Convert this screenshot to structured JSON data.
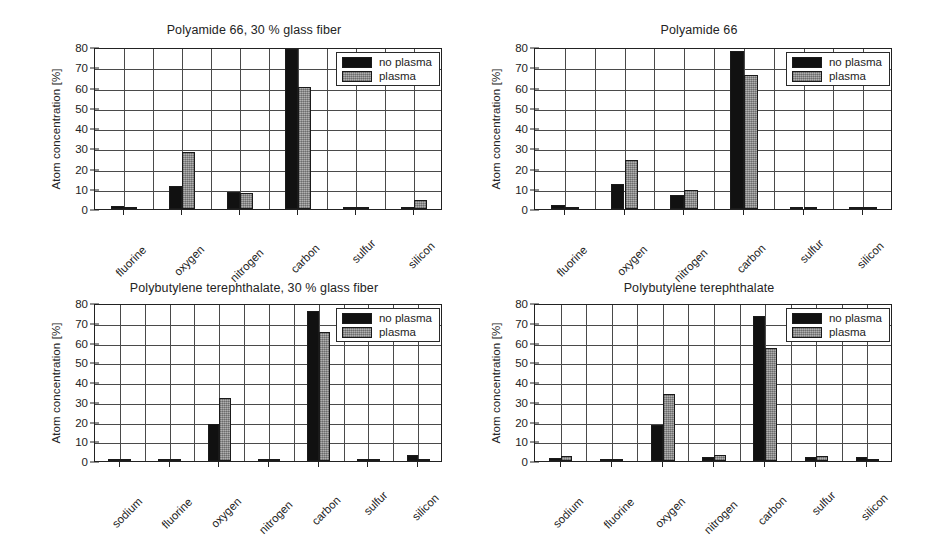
{
  "figure": {
    "background": "#ffffff",
    "axis_color": "#222222",
    "grid_color": "#4a4a4a",
    "series_colors": [
      "#111111",
      "#9d9d9d"
    ]
  },
  "chart_data": [
    {
      "type": "bar",
      "title": "Polyamide 66, 30 % glass fiber",
      "xlabel": "",
      "ylabel": "Atom concentration [%]",
      "ylim": [
        0,
        80
      ],
      "yticks": [
        0,
        10,
        20,
        30,
        40,
        50,
        60,
        70,
        80
      ],
      "grid": true,
      "legend_position": "top-right",
      "categories": [
        "fluorine",
        "oxygen",
        "nitrogen",
        "carbon",
        "sulfur",
        "silicon"
      ],
      "series": [
        {
          "name": "no plasma",
          "values": [
            1.3,
            11.2,
            8.3,
            79.0,
            0.3,
            1.2
          ]
        },
        {
          "name": "plasma",
          "values": [
            0.2,
            28.3,
            7.9,
            60.4,
            0.3,
            4.3
          ]
        }
      ]
    },
    {
      "type": "bar",
      "title": "Polyamide 66",
      "xlabel": "",
      "ylabel": "Atom concentration [%]",
      "ylim": [
        0,
        80
      ],
      "yticks": [
        0,
        10,
        20,
        30,
        40,
        50,
        60,
        70,
        80
      ],
      "grid": true,
      "legend_position": "top-right",
      "categories": [
        "fluorine",
        "oxygen",
        "nitrogen",
        "carbon",
        "sulfur",
        "silicon"
      ],
      "series": [
        {
          "name": "no plasma",
          "values": [
            1.8,
            12.4,
            7.1,
            78.2,
            0.6,
            0.6
          ]
        },
        {
          "name": "plasma",
          "values": [
            0.2,
            24.1,
            9.3,
            66.2,
            0.5,
            0.5
          ]
        }
      ]
    },
    {
      "type": "bar",
      "title": "Polybutylene terephthalate, 30 % glass fiber",
      "xlabel": "",
      "ylabel": "Atom concentration [%]",
      "ylim": [
        0,
        80
      ],
      "yticks": [
        0,
        10,
        20,
        30,
        40,
        50,
        60,
        70,
        80
      ],
      "grid": true,
      "legend_position": "top-right",
      "categories": [
        "sodium",
        "fluorine",
        "oxygen",
        "nitrogen",
        "carbon",
        "sulfur",
        "silicon"
      ],
      "series": [
        {
          "name": "no plasma",
          "values": [
            0.6,
            1.1,
            18.5,
            1.1,
            76.2,
            0.9,
            3.0
          ]
        },
        {
          "name": "plasma",
          "values": [
            0.5,
            0.3,
            32.0,
            1.0,
            65.3,
            0.8,
            1.1
          ]
        }
      ]
    },
    {
      "type": "bar",
      "title": "Polybutylene terephthalate",
      "xlabel": "",
      "ylabel": "Atom concentration [%]",
      "ylim": [
        0,
        80
      ],
      "yticks": [
        0,
        10,
        20,
        30,
        40,
        50,
        60,
        70,
        80
      ],
      "grid": true,
      "legend_position": "top-right",
      "categories": [
        "sodium",
        "fluorine",
        "oxygen",
        "nitrogen",
        "carbon",
        "sulfur",
        "silicon"
      ],
      "series": [
        {
          "name": "no plasma",
          "values": [
            1.4,
            1.2,
            18.4,
            1.8,
            73.2,
            2.2,
            2.1
          ]
        },
        {
          "name": "plasma",
          "values": [
            2.6,
            0.6,
            33.7,
            2.9,
            57.4,
            2.3,
            1.0
          ]
        }
      ]
    }
  ]
}
